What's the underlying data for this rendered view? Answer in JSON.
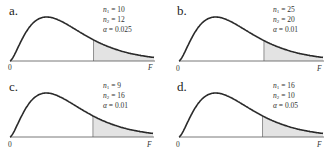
{
  "figure": {
    "panels": [
      {
        "id": "a",
        "label": "a.",
        "n1": "10",
        "n2": "12",
        "alpha": "0.025",
        "x_zero_label": "0",
        "x_axis_label": "F",
        "shade_start_frac": 0.58
      },
      {
        "id": "b",
        "label": "b.",
        "n1": "25",
        "n2": "20",
        "alpha": "0.01",
        "x_zero_label": "0",
        "x_axis_label": "F",
        "shade_start_frac": 0.59
      },
      {
        "id": "c",
        "label": "c.",
        "n1": "9",
        "n2": "16",
        "alpha": "0.01",
        "x_zero_label": "0",
        "x_axis_label": "F",
        "shade_start_frac": 0.58
      },
      {
        "id": "d",
        "label": "d.",
        "n1": "16",
        "n2": "10",
        "alpha": "0.05",
        "x_zero_label": "0",
        "x_axis_label": "F",
        "shade_start_frac": 0.58
      }
    ],
    "symbols": {
      "n": "n",
      "alpha": "α",
      "eq": " = "
    },
    "colors": {
      "curve": "#2a2a2a",
      "axis": "#555555",
      "shade": "#e3e3e3",
      "shade_edge": "#777777"
    }
  }
}
